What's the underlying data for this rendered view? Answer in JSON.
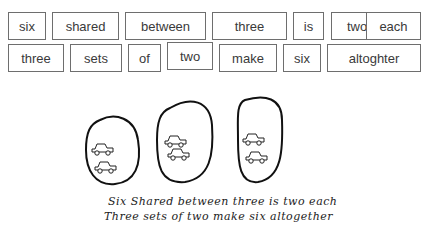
{
  "word_cards": {
    "row1": [
      {
        "text": "six",
        "x": 8,
        "y": 12,
        "w": 38,
        "h": 28
      },
      {
        "text": "shared",
        "x": 52,
        "y": 12,
        "w": 67,
        "h": 28
      },
      {
        "text": "between",
        "x": 125,
        "y": 12,
        "w": 81,
        "h": 28
      },
      {
        "text": "three",
        "x": 212,
        "y": 12,
        "w": 75,
        "h": 28
      },
      {
        "text": "is",
        "x": 293,
        "y": 12,
        "w": 31,
        "h": 28
      },
      {
        "text": "two",
        "x": 331,
        "y": 12,
        "w": 52,
        "h": 28
      },
      {
        "text": "each",
        "x": 366,
        "y": 12,
        "w": 55,
        "h": 28
      }
    ],
    "row2": [
      {
        "text": "three",
        "x": 8,
        "y": 44,
        "w": 56,
        "h": 28
      },
      {
        "text": "sets",
        "x": 70,
        "y": 44,
        "w": 52,
        "h": 28
      },
      {
        "text": "of",
        "x": 128,
        "y": 44,
        "w": 33,
        "h": 28
      },
      {
        "text": "two",
        "x": 167,
        "y": 42,
        "w": 46,
        "h": 28
      },
      {
        "text": "make",
        "x": 219,
        "y": 44,
        "w": 58,
        "h": 28
      },
      {
        "text": "six",
        "x": 283,
        "y": 44,
        "w": 38,
        "h": 28
      },
      {
        "text": "altoghter",
        "x": 327,
        "y": 44,
        "w": 94,
        "h": 28
      }
    ]
  },
  "drawing": {
    "groups": 3,
    "items_per_group": 2,
    "item_icon": "car-icon"
  },
  "handwriting": {
    "line1": "Six Shared between three is two each",
    "line2": "Three sets of two make six altogether"
  }
}
